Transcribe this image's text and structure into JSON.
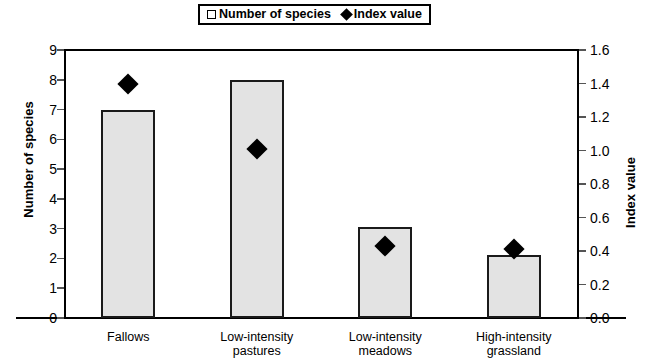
{
  "legend": {
    "position": "top-center",
    "entries": [
      {
        "label": "Number of species",
        "marker": "square-outline-icon"
      },
      {
        "label": "Index value",
        "marker": "diamond-icon"
      }
    ]
  },
  "axes": {
    "left": {
      "title": "Number of species",
      "min": 0,
      "max": 9,
      "step": 1,
      "ticks": [
        "0",
        "1",
        "2",
        "3",
        "4",
        "5",
        "6",
        "7",
        "8",
        "9"
      ]
    },
    "right": {
      "title": "Index value",
      "min": 0.0,
      "max": 1.6,
      "step": 0.2,
      "ticks": [
        "0.0",
        "0.2",
        "0.4",
        "0.6",
        "0.8",
        "1.0",
        "1.2",
        "1.4",
        "1.6"
      ]
    },
    "bottom": {
      "categories": [
        "Fallows",
        "Low-intensity\npastures",
        "Low-intensity\nmeadows",
        "High-intensity\ngrassland"
      ]
    }
  },
  "colors": {
    "bar_fill": "#e3e3e3",
    "bar_border": "#1a1a1a",
    "marker": "#000000",
    "axis": "#000000",
    "background": "#ffffff"
  },
  "chart_data": {
    "type": "bar",
    "title": "",
    "subtitle": "",
    "xlabel": "",
    "ylabel": "Number of species",
    "y2label": "Index value",
    "categories": [
      "Fallows",
      "Low-intensity pastures",
      "Low-intensity meadows",
      "High-intensity grassland"
    ],
    "series": [
      {
        "name": "Number of species",
        "type": "bar",
        "axis": "left",
        "values": [
          7.0,
          8.0,
          3.05,
          2.1
        ]
      },
      {
        "name": "Index value",
        "type": "scatter",
        "marker": "diamond",
        "axis": "right",
        "values": [
          1.4,
          1.01,
          0.43,
          0.41
        ]
      }
    ],
    "ylim": [
      0,
      9
    ],
    "y2lim": [
      0.0,
      1.6
    ],
    "grid": false,
    "legend_position": "top-center"
  }
}
